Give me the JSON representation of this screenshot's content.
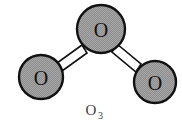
{
  "figure": {
    "name": "ozone-molecule-diagram",
    "type": "ball-and-stick molecular structure",
    "background_color": "#ffffff"
  },
  "molecule": {
    "formula_main": "O",
    "formula_subscript": "3",
    "formula_full": "O3",
    "atoms": [
      {
        "id": "atom-top",
        "label": "O",
        "element": "oxygen",
        "role": "central",
        "cx": 101,
        "cy": 29,
        "r": 24,
        "fill_color": "#949494",
        "stroke_color": "#111111"
      },
      {
        "id": "atom-left",
        "label": "O",
        "element": "oxygen",
        "role": "terminal-left",
        "cx": 41,
        "cy": 77,
        "r": 22,
        "fill_color": "#949494",
        "stroke_color": "#111111"
      },
      {
        "id": "atom-right",
        "label": "O",
        "element": "oxygen",
        "role": "terminal-right",
        "cx": 155,
        "cy": 82,
        "r": 21,
        "fill_color": "#949494",
        "stroke_color": "#111111"
      }
    ],
    "bonds": [
      {
        "id": "bond-left",
        "from": "atom-top",
        "to": "atom-left",
        "style": "rod",
        "fill_color": "#ffffff",
        "stroke_color": "#111111",
        "points": "82,45 57,63 62,71 87,53"
      },
      {
        "id": "bond-right",
        "from": "atom-top",
        "to": "atom-right",
        "style": "rod",
        "fill_color": "#ffffff",
        "stroke_color": "#111111",
        "points": "117,44 141,64 136,72 112,52"
      }
    ]
  },
  "caption": {
    "label": "O3",
    "x": 94,
    "y": 114,
    "color": "#3a3a3a"
  }
}
